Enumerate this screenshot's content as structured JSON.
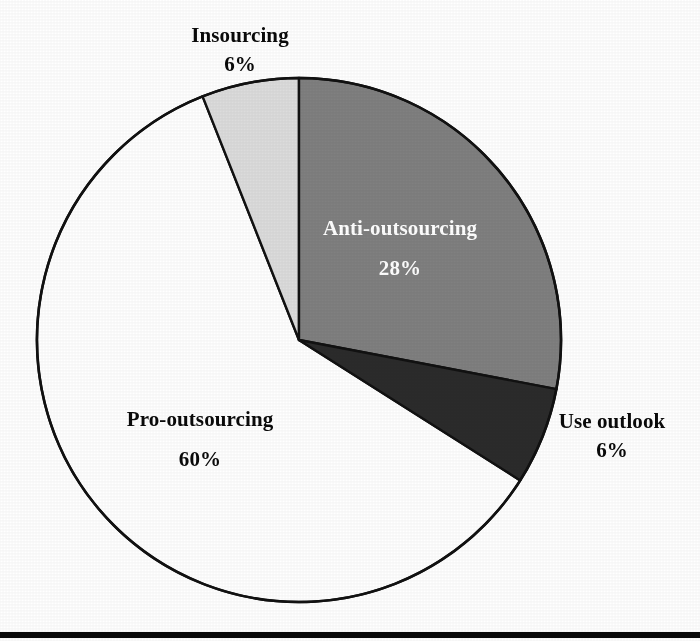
{
  "chart_data": {
    "type": "pie",
    "title": "",
    "subtitle": "",
    "xlabel": "",
    "ylabel": "",
    "legend_position": "none",
    "grid": false,
    "value_unit": "%",
    "total": 100,
    "start_angle_deg": 0,
    "direction": "clockwise",
    "categories": [
      "Anti-outsourcing",
      "Use outlook",
      "Pro-outsourcing",
      "Insourcing"
    ],
    "values": [
      28,
      6,
      60,
      6
    ],
    "slices": [
      {
        "name": "Anti-outsourcing",
        "value": 28,
        "value_label": "28%",
        "color": "#808080",
        "label_color": "#ffffff",
        "label_placement": "inside"
      },
      {
        "name": "Use outlook",
        "value": 6,
        "value_label": "6%",
        "color": "#2b2b2b",
        "label_color": "#0a0a0a",
        "label_placement": "outside-right"
      },
      {
        "name": "Pro-outsourcing",
        "value": 60,
        "value_label": "60%",
        "color": "#ffffff",
        "label_color": "#0a0a0a",
        "label_placement": "inside"
      },
      {
        "name": "Insourcing",
        "value": 6,
        "value_label": "6%",
        "color": "#dcdcdc",
        "label_color": "#0a0a0a",
        "label_placement": "outside-top"
      }
    ],
    "outline_color": "#111111"
  },
  "figure": {
    "rule_color": "#0b0b0b"
  }
}
